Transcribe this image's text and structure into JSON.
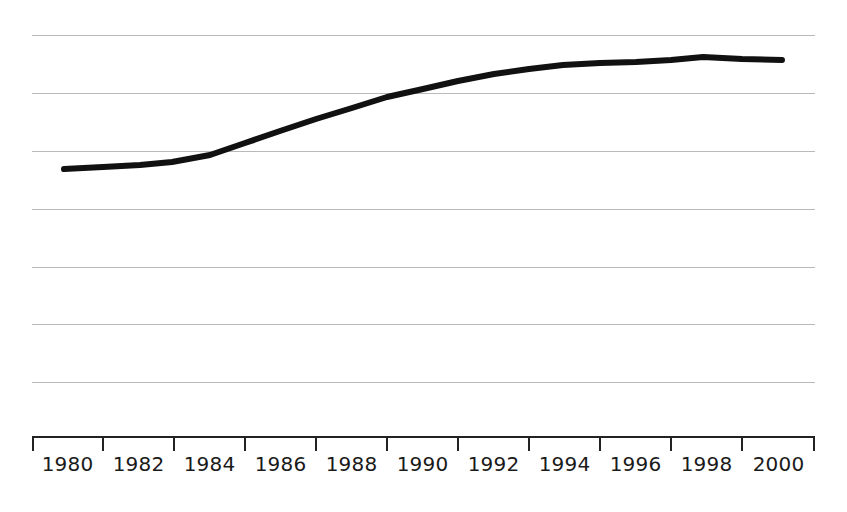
{
  "chart_data": {
    "type": "line",
    "title": "",
    "subtitle": "",
    "xlabel": "",
    "ylabel": "",
    "grid": true,
    "legend": false,
    "legend_position": "none",
    "line_color": "#111111",
    "grid_color": "#b9b9b9",
    "axis_color": "#222222",
    "line_width": 6,
    "x_tick_labels": [
      "1980",
      "1982",
      "1984",
      "1986",
      "1988",
      "1990",
      "1992",
      "1994",
      "1996",
      "1998",
      "2000"
    ],
    "x_tick_count": 12,
    "xlim": [
      1979,
      2001
    ],
    "y_axis_labels": [],
    "y_gridline_count": 7,
    "ylim": [
      0,
      7
    ],
    "x": [
      1980,
      1982,
      1984,
      1986,
      1988,
      1990,
      1992,
      1994,
      1996,
      1998,
      2000
    ],
    "values": [
      3.78,
      3.82,
      3.9,
      4.3,
      4.82,
      5.3,
      5.72,
      6.08,
      6.14,
      6.24,
      6.18
    ]
  },
  "axis": {
    "x_ticks_px": [
      32,
      103,
      174,
      245,
      316,
      387,
      458,
      529,
      600,
      671,
      742,
      815
    ],
    "axis_line_y_px": 7,
    "tick_length_px": 14
  },
  "gridlines_px": [
    35,
    93,
    151,
    209,
    267,
    324,
    382
  ],
  "series_points_px": [
    [
      64,
      169
    ],
    [
      103,
      167
    ],
    [
      140,
      165
    ],
    [
      172,
      162
    ],
    [
      210,
      155
    ],
    [
      245,
      143
    ],
    [
      280,
      131
    ],
    [
      316,
      119
    ],
    [
      352,
      108
    ],
    [
      387,
      97
    ],
    [
      423,
      89
    ],
    [
      458,
      81
    ],
    [
      494,
      74
    ],
    [
      529,
      69
    ],
    [
      563,
      65
    ],
    [
      600,
      63
    ],
    [
      636,
      62
    ],
    [
      671,
      60
    ],
    [
      703,
      57
    ],
    [
      742,
      59
    ],
    [
      782,
      60
    ]
  ]
}
